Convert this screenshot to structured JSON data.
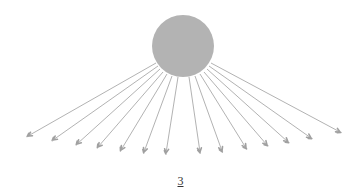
{
  "diagram": {
    "hub": {
      "cx": 183,
      "cy": 46,
      "r": 31,
      "fill": "#b3b3b3"
    },
    "ray_color": "#a9a9a9",
    "arrow_color": "#a0a0a0",
    "rays": [
      {
        "x1": 156,
        "y1": 63,
        "x2": 28,
        "y2": 136
      },
      {
        "x1": 158,
        "y1": 66,
        "x2": 53,
        "y2": 140
      },
      {
        "x1": 160,
        "y1": 69,
        "x2": 77,
        "y2": 144
      },
      {
        "x1": 163,
        "y1": 72,
        "x2": 98,
        "y2": 147
      },
      {
        "x1": 167,
        "y1": 74,
        "x2": 121,
        "y2": 150
      },
      {
        "x1": 172,
        "y1": 76,
        "x2": 144,
        "y2": 152
      },
      {
        "x1": 178,
        "y1": 77,
        "x2": 166,
        "y2": 153
      },
      {
        "x1": 189,
        "y1": 77,
        "x2": 200,
        "y2": 152
      },
      {
        "x1": 195,
        "y1": 76,
        "x2": 222,
        "y2": 151
      },
      {
        "x1": 200,
        "y1": 74,
        "x2": 246,
        "y2": 148
      },
      {
        "x1": 204,
        "y1": 72,
        "x2": 267,
        "y2": 145
      },
      {
        "x1": 207,
        "y1": 69,
        "x2": 288,
        "y2": 142
      },
      {
        "x1": 209,
        "y1": 66,
        "x2": 311,
        "y2": 138
      },
      {
        "x1": 211,
        "y1": 63,
        "x2": 340,
        "y2": 132
      }
    ]
  },
  "footer": {
    "page_number": "3"
  }
}
